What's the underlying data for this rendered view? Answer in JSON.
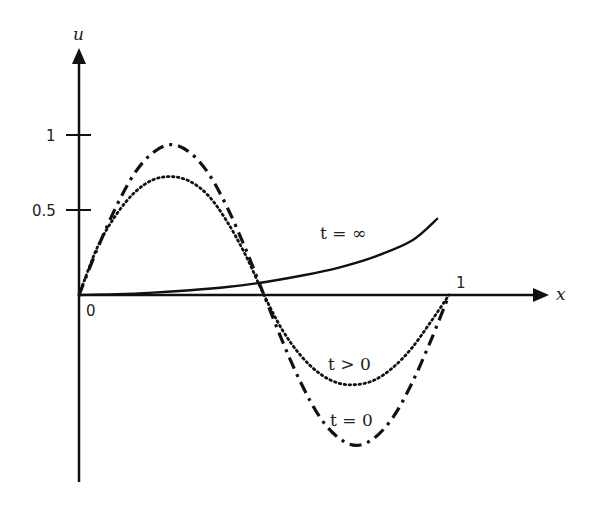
{
  "chart_data": {
    "type": "line",
    "title": "",
    "xlabel": "x",
    "ylabel": "u",
    "xlim": [
      0,
      1.08
    ],
    "ylim": [
      -1.2,
      1.35
    ],
    "grid": false,
    "legend_position": "inline annotations",
    "x_ticks": [
      {
        "value": 0,
        "label": "0"
      },
      {
        "value": 1,
        "label": "1"
      }
    ],
    "y_ticks": [
      {
        "value": 0.5,
        "label": "0.5"
      },
      {
        "value": 1,
        "label": "1"
      }
    ],
    "series": [
      {
        "name": "t = 0",
        "style": "dash-dot",
        "description": "initial condition, approximately 0.94*sin(2*pi*x)",
        "x": [
          0,
          0.05,
          0.1,
          0.15,
          0.2,
          0.25,
          0.3,
          0.35,
          0.4,
          0.45,
          0.5,
          0.55,
          0.6,
          0.65,
          0.7,
          0.75,
          0.8,
          0.85,
          0.9,
          0.95,
          1.0
        ],
        "values": [
          0,
          0.29,
          0.55,
          0.76,
          0.89,
          0.94,
          0.89,
          0.76,
          0.55,
          0.29,
          0,
          -0.29,
          -0.55,
          -0.76,
          -0.89,
          -0.94,
          -0.89,
          -0.76,
          -0.55,
          -0.29,
          0
        ]
      },
      {
        "name": "t > 0",
        "style": "dotted",
        "description": "intermediate time, decaying towards steady state",
        "x": [
          0,
          0.05,
          0.1,
          0.15,
          0.2,
          0.25,
          0.3,
          0.35,
          0.4,
          0.45,
          0.5,
          0.55,
          0.6,
          0.65,
          0.7,
          0.75,
          0.8,
          0.85,
          0.9,
          0.95,
          1.0
        ],
        "values": [
          0,
          0.3,
          0.5,
          0.64,
          0.72,
          0.74,
          0.71,
          0.62,
          0.46,
          0.25,
          0,
          -0.22,
          -0.38,
          -0.49,
          -0.55,
          -0.56,
          -0.53,
          -0.45,
          -0.33,
          -0.17,
          0
        ]
      },
      {
        "name": "t = ∞",
        "style": "solid",
        "description": "steady state, monotonically increasing from 0",
        "x": [
          0,
          0.1,
          0.2,
          0.3,
          0.4,
          0.5,
          0.6,
          0.7,
          0.8,
          0.9,
          0.97
        ],
        "values": [
          0,
          0.005,
          0.015,
          0.03,
          0.05,
          0.08,
          0.12,
          0.17,
          0.24,
          0.34,
          0.48
        ]
      }
    ],
    "annotations": [
      {
        "text": "t = ∞",
        "x": 0.68,
        "y": 0.62
      },
      {
        "text": "t > 0",
        "x": 0.73,
        "y": -0.38
      },
      {
        "text": "t = 0",
        "x": 0.73,
        "y": -0.73
      }
    ]
  },
  "labels": {
    "y_axis": "u",
    "x_axis": "x",
    "origin": "0",
    "x_one": "1",
    "y_one": "1",
    "y_half": "0.5",
    "ann_inf": "t = ∞",
    "ann_pos": "t > 0",
    "ann_zero": "t = 0"
  }
}
